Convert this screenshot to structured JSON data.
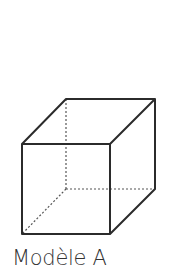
{
  "figure": {
    "type": "cube-wireframe",
    "caption": "Modèle A",
    "colors": {
      "edge": "#2b2b2b",
      "hidden_edge": "#555555",
      "caption": "#333333"
    }
  }
}
